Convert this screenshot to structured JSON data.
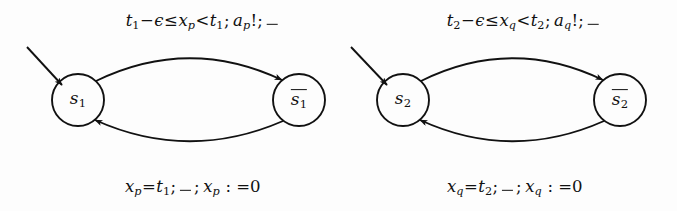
{
  "figure": {
    "name": "timed-automata-pair",
    "background": "#fdfdfd",
    "ink": "#111111",
    "width": 677,
    "height": 211
  },
  "automata": [
    {
      "id": "automaton-p",
      "clock": "x_p",
      "deadline": "t_1",
      "action": "a_p!",
      "initial_state": {
        "name": "state-s1",
        "base": "s",
        "index": "1",
        "overlined": false,
        "cx": 78,
        "cy": 100,
        "r": 26
      },
      "target_state": {
        "name": "state-s1-bar",
        "base": "s",
        "index": "1",
        "overlined": true,
        "cx": 299,
        "cy": 100,
        "r": 26
      },
      "top_label": {
        "name": "edge-label-forward-p",
        "x": 203,
        "y": 22,
        "parts": [
          {
            "t": "t",
            "k": "it"
          },
          {
            "t": "1",
            "k": "sub"
          },
          {
            "t": "−",
            "k": "op"
          },
          {
            "t": "ϵ",
            "k": "it"
          },
          {
            "t": "≤",
            "k": "op"
          },
          {
            "t": "x",
            "k": "it"
          },
          {
            "t": "p",
            "k": "sub"
          },
          {
            "t": "<",
            "k": "op"
          },
          {
            "t": "t",
            "k": "it"
          },
          {
            "t": "1",
            "k": "sub"
          },
          {
            "t": ";",
            "k": "op"
          },
          {
            "t": " ",
            "k": "sp"
          },
          {
            "t": "a",
            "k": "it"
          },
          {
            "t": "p",
            "k": "sub"
          },
          {
            "t": "!;",
            "k": "op"
          },
          {
            "t": "_",
            "k": "blank"
          }
        ],
        "plain": "t1−ϵ≤xp<t1; ap!; _"
      },
      "bottom_label": {
        "name": "edge-label-reset-p",
        "x": 193,
        "y": 188,
        "parts": [
          {
            "t": "x",
            "k": "it"
          },
          {
            "t": "p",
            "k": "sub"
          },
          {
            "t": "=",
            "k": "op"
          },
          {
            "t": "t",
            "k": "it"
          },
          {
            "t": "1",
            "k": "sub"
          },
          {
            "t": ";",
            "k": "op"
          },
          {
            "t": "_",
            "k": "blank"
          },
          {
            "t": ";",
            "k": "op"
          },
          {
            "t": " ",
            "k": "sp"
          },
          {
            "t": "x",
            "k": "it"
          },
          {
            "t": "p",
            "k": "sub"
          },
          {
            "t": " : =0",
            "k": "op"
          }
        ],
        "plain": "xp=t1; _ ; xp : =0"
      },
      "entry_arrow": {
        "name": "initial-arrow-p",
        "x1": 27,
        "y1": 47,
        "x2": 62,
        "y2": 85
      }
    },
    {
      "id": "automaton-q",
      "clock": "x_q",
      "deadline": "t_2",
      "action": "a_q!",
      "initial_state": {
        "name": "state-s2",
        "base": "s",
        "index": "2",
        "overlined": false,
        "cx": 66,
        "cy": 100,
        "r": 26
      },
      "target_state": {
        "name": "state-s2-bar",
        "base": "s",
        "index": "2",
        "overlined": true,
        "cx": 283,
        "cy": 100,
        "r": 26
      },
      "top_label": {
        "name": "edge-label-forward-q",
        "x": 187,
        "y": 22,
        "parts": [
          {
            "t": "t",
            "k": "it"
          },
          {
            "t": "2",
            "k": "sub"
          },
          {
            "t": "−",
            "k": "op"
          },
          {
            "t": "ϵ",
            "k": "it"
          },
          {
            "t": "≤",
            "k": "op"
          },
          {
            "t": "x",
            "k": "it"
          },
          {
            "t": "q",
            "k": "sub"
          },
          {
            "t": "<",
            "k": "op"
          },
          {
            "t": "t",
            "k": "it"
          },
          {
            "t": "2",
            "k": "sub"
          },
          {
            "t": ";",
            "k": "op"
          },
          {
            "t": " ",
            "k": "sp"
          },
          {
            "t": "a",
            "k": "it"
          },
          {
            "t": "q",
            "k": "sub"
          },
          {
            "t": "!;",
            "k": "op"
          },
          {
            "t": "_",
            "k": "blank"
          }
        ],
        "plain": "t2−ϵ≤xq<t2; aq!; _"
      },
      "bottom_label": {
        "name": "edge-label-reset-q",
        "x": 178,
        "y": 188,
        "parts": [
          {
            "t": "x",
            "k": "it"
          },
          {
            "t": "q",
            "k": "sub"
          },
          {
            "t": "=",
            "k": "op"
          },
          {
            "t": "t",
            "k": "it"
          },
          {
            "t": "2",
            "k": "sub"
          },
          {
            "t": ";",
            "k": "op"
          },
          {
            "t": "_",
            "k": "blank"
          },
          {
            "t": ";",
            "k": "op"
          },
          {
            "t": " ",
            "k": "sp"
          },
          {
            "t": "x",
            "k": "it"
          },
          {
            "t": "q",
            "k": "sub"
          },
          {
            "t": " : =0",
            "k": "op"
          }
        ],
        "plain": "xq=t2; _ ; xq : =0"
      },
      "entry_arrow": {
        "name": "initial-arrow-q",
        "x1": 14,
        "y1": 47,
        "x2": 50,
        "y2": 85
      }
    }
  ]
}
